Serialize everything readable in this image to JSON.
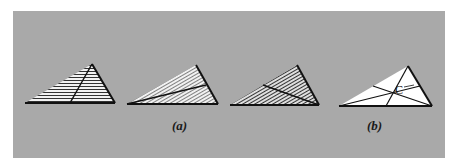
{
  "figure": {
    "background_color": "#a9a9a9",
    "stroke_color": "#111111",
    "fill_white": "#ffffff",
    "captions": {
      "a": "(a)",
      "b": "(b)"
    },
    "centroid_label": "C",
    "panels": [
      {
        "id": "a1",
        "description": "triangle with horizontal hatching, line from apex to base",
        "hatch": "horizontal",
        "vertices": [
          [
            25,
            103
          ],
          [
            115,
            103
          ],
          [
            92,
            64
          ]
        ],
        "inner_line": [
          [
            92,
            64
          ],
          [
            70,
            103
          ]
        ]
      },
      {
        "id": "a2",
        "description": "triangle with steep diagonal hatching, median from left vertex to right edge",
        "hatch": "diagonal-steep",
        "vertices": [
          [
            127,
            104
          ],
          [
            218,
            104
          ],
          [
            196,
            65
          ]
        ],
        "inner_line": [
          [
            127,
            104
          ],
          [
            206,
            85
          ]
        ]
      },
      {
        "id": "a3",
        "description": "triangle with diagonal hatching, median from right vertex to left edge",
        "hatch": "diagonal",
        "vertices": [
          [
            230,
            105
          ],
          [
            319,
            105
          ],
          [
            297,
            65
          ]
        ],
        "inner_line": [
          [
            319,
            105
          ],
          [
            263,
            85
          ]
        ]
      },
      {
        "id": "b",
        "description": "white triangle with three medians meeting at centroid C",
        "hatch": "none",
        "vertices": [
          [
            339,
            106
          ],
          [
            432,
            106
          ],
          [
            408,
            66
          ]
        ],
        "medians": [
          [
            [
              408,
              66
            ],
            [
              386,
              106
            ]
          ],
          [
            [
              339,
              106
            ],
            [
              420,
              86
            ]
          ],
          [
            [
              432,
              106
            ],
            [
              373,
              86
            ]
          ]
        ],
        "centroid": [
          393,
          93
        ]
      }
    ]
  }
}
